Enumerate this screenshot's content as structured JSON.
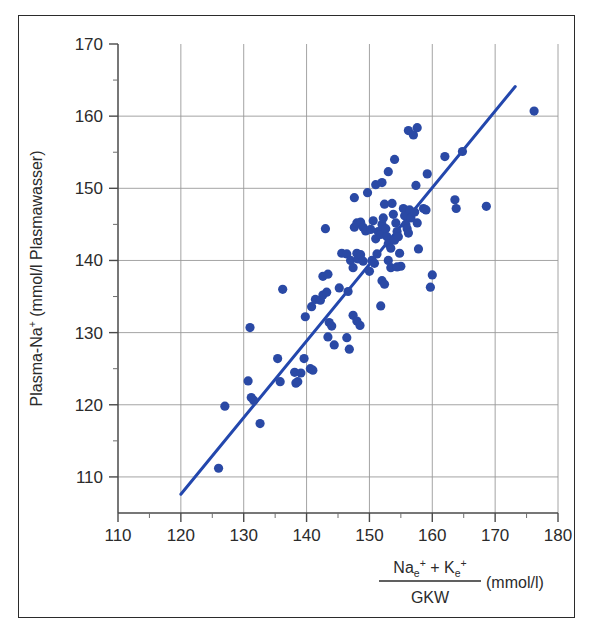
{
  "figure": {
    "border_color": "#2b2b2b",
    "background": "#ffffff"
  },
  "chart_data": {
    "type": "scatter",
    "title": "",
    "subtitle": "",
    "xlabel": "(Na_e+ + K_e+) / GKW (mmol/l)",
    "ylabel": "Plasma-Na+ (mmol/l Plasmawasser)",
    "xlabel_parts": {
      "numerator_a": "Na",
      "numerator_a_sub": "e",
      "numerator_a_sup": "+",
      "plus": "+",
      "numerator_b": "K",
      "numerator_b_sub": "e",
      "numerator_b_sup": "+",
      "denominator": "GKW",
      "unit": "(mmol/l)"
    },
    "ylabel_parts": {
      "main": "Plasma-Na",
      "sup": "+",
      "unit": " (mmol/l Plasmawasser)"
    },
    "xlim": [
      110,
      180
    ],
    "ylim": [
      105,
      170
    ],
    "x_ticks": [
      110,
      120,
      130,
      140,
      150,
      160,
      170,
      180
    ],
    "y_ticks": [
      110,
      120,
      130,
      140,
      150,
      160,
      170
    ],
    "x_tick_labels": [
      "110",
      "120",
      "130",
      "140",
      "150",
      "160",
      "170",
      "180"
    ],
    "y_tick_labels": [
      "110",
      "120",
      "130",
      "140",
      "150",
      "160",
      "170"
    ],
    "x_minor_step": 5,
    "y_minor_step": 5,
    "grid": true,
    "grid_color": "#9a9a9a",
    "legend": null,
    "marker_color": "#2a49a5",
    "marker_radius": 4.6,
    "line_color": "#2347ad",
    "line_width": 3.0,
    "regression_line": {
      "x0": 120.0,
      "y0": 107.6,
      "x1": 173.2,
      "y1": 164.1
    },
    "points": [
      [
        126.0,
        111.2
      ],
      [
        127.0,
        119.8
      ],
      [
        132.6,
        117.4
      ],
      [
        130.7,
        123.3
      ],
      [
        131.2,
        121.0
      ],
      [
        131.6,
        120.6
      ],
      [
        131.0,
        130.7
      ],
      [
        135.4,
        126.4
      ],
      [
        135.8,
        123.2
      ],
      [
        138.3,
        123.0
      ],
      [
        138.6,
        123.2
      ],
      [
        138.1,
        124.5
      ],
      [
        139.1,
        124.4
      ],
      [
        139.6,
        126.4
      ],
      [
        140.6,
        125.0
      ],
      [
        141.0,
        124.8
      ],
      [
        136.2,
        136.0
      ],
      [
        139.8,
        132.2
      ],
      [
        140.8,
        133.6
      ],
      [
        141.4,
        134.6
      ],
      [
        142.2,
        134.5
      ],
      [
        142.6,
        135.2
      ],
      [
        143.2,
        135.6
      ],
      [
        143.0,
        144.4
      ],
      [
        143.6,
        131.4
      ],
      [
        144.0,
        130.9
      ],
      [
        144.4,
        128.3
      ],
      [
        143.4,
        129.4
      ],
      [
        142.6,
        137.8
      ],
      [
        143.4,
        138.1
      ],
      [
        145.2,
        136.2
      ],
      [
        146.6,
        135.7
      ],
      [
        146.4,
        129.3
      ],
      [
        146.8,
        127.7
      ],
      [
        147.4,
        132.4
      ],
      [
        148.0,
        131.6
      ],
      [
        148.5,
        131.0
      ],
      [
        145.6,
        141.0
      ],
      [
        146.4,
        140.9
      ],
      [
        147.0,
        140.0
      ],
      [
        147.4,
        139.0
      ],
      [
        148.0,
        141.0
      ],
      [
        148.2,
        140.2
      ],
      [
        148.6,
        140.8
      ],
      [
        149.0,
        139.9
      ],
      [
        147.6,
        144.6
      ],
      [
        148.0,
        145.2
      ],
      [
        148.6,
        145.3
      ],
      [
        149.0,
        144.6
      ],
      [
        149.4,
        144.1
      ],
      [
        147.6,
        148.7
      ],
      [
        149.7,
        149.4
      ],
      [
        150.0,
        138.5
      ],
      [
        150.4,
        140.0
      ],
      [
        150.8,
        139.6
      ],
      [
        151.2,
        140.9
      ],
      [
        151.0,
        143.0
      ],
      [
        151.4,
        144.0
      ],
      [
        151.8,
        143.6
      ],
      [
        152.0,
        145.0
      ],
      [
        150.6,
        145.5
      ],
      [
        150.2,
        144.3
      ],
      [
        151.0,
        150.5
      ],
      [
        152.0,
        150.8
      ],
      [
        152.4,
        147.8
      ],
      [
        152.2,
        145.9
      ],
      [
        152.6,
        144.4
      ],
      [
        152.8,
        143.3
      ],
      [
        153.0,
        142.3
      ],
      [
        153.4,
        141.7
      ],
      [
        153.0,
        140.0
      ],
      [
        153.4,
        139.0
      ],
      [
        152.0,
        137.2
      ],
      [
        152.4,
        136.7
      ],
      [
        151.8,
        133.7
      ],
      [
        153.0,
        152.3
      ],
      [
        154.0,
        154.0
      ],
      [
        153.6,
        147.9
      ],
      [
        153.8,
        146.4
      ],
      [
        154.2,
        145.2
      ],
      [
        154.4,
        144.0
      ],
      [
        154.0,
        142.8
      ],
      [
        154.6,
        143.3
      ],
      [
        154.8,
        141.0
      ],
      [
        155.0,
        139.2
      ],
      [
        154.4,
        139.1
      ],
      [
        155.4,
        147.2
      ],
      [
        155.6,
        146.2
      ],
      [
        155.8,
        145.0
      ],
      [
        156.0,
        144.4
      ],
      [
        156.2,
        143.8
      ],
      [
        156.4,
        147.0
      ],
      [
        156.6,
        145.9
      ],
      [
        156.2,
        158.0
      ],
      [
        157.0,
        157.4
      ],
      [
        157.6,
        158.4
      ],
      [
        157.4,
        150.4
      ],
      [
        157.2,
        146.7
      ],
      [
        157.6,
        145.2
      ],
      [
        157.8,
        141.6
      ],
      [
        158.6,
        147.2
      ],
      [
        159.0,
        147.0
      ],
      [
        159.2,
        152.0
      ],
      [
        160.0,
        138.0
      ],
      [
        159.7,
        136.3
      ],
      [
        162.0,
        154.4
      ],
      [
        164.8,
        155.1
      ],
      [
        163.6,
        148.4
      ],
      [
        163.8,
        147.2
      ],
      [
        168.6,
        147.5
      ],
      [
        176.2,
        160.7
      ]
    ]
  }
}
